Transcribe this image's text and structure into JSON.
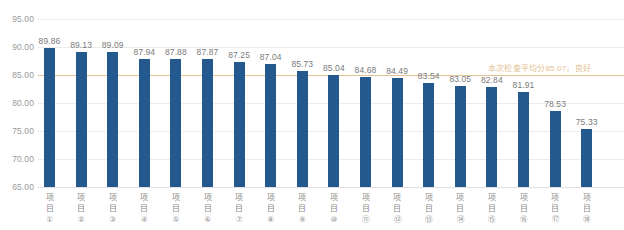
{
  "chart_data": {
    "type": "bar",
    "title": "",
    "xlabel": "",
    "ylabel": "",
    "ylim": [
      65,
      95
    ],
    "grid": true,
    "legend": "none",
    "yticks": [
      "95.00",
      "90.00",
      "85.00",
      "80.00",
      "75.00",
      "70.00",
      "65.00"
    ],
    "ytick_values": [
      95,
      90,
      85,
      80,
      75,
      70,
      65
    ],
    "categories": [
      "项目①",
      "项目②",
      "项目③",
      "项目④",
      "项目⑤",
      "项目⑥",
      "项目⑦",
      "项目⑧",
      "项目⑨",
      "项目⑩",
      "项目⑪",
      "项目⑫",
      "项目⑬",
      "项目⑭",
      "项目⑮",
      "项目⑯",
      "项目⑰",
      "项目⑱"
    ],
    "category_parts": [
      {
        "word": "项目",
        "num": "①"
      },
      {
        "word": "项目",
        "num": "②"
      },
      {
        "word": "项目",
        "num": "③"
      },
      {
        "word": "项目",
        "num": "④"
      },
      {
        "word": "项目",
        "num": "⑤"
      },
      {
        "word": "项目",
        "num": "⑥"
      },
      {
        "word": "项目",
        "num": "⑦"
      },
      {
        "word": "项目",
        "num": "⑧"
      },
      {
        "word": "项目",
        "num": "⑨"
      },
      {
        "word": "项目",
        "num": "⑩"
      },
      {
        "word": "项目",
        "num": "⑪"
      },
      {
        "word": "项目",
        "num": "⑫"
      },
      {
        "word": "项目",
        "num": "⑬"
      },
      {
        "word": "项目",
        "num": "⑭"
      },
      {
        "word": "项目",
        "num": "⑮"
      },
      {
        "word": "项目",
        "num": "⑯"
      },
      {
        "word": "项目",
        "num": "⑰"
      },
      {
        "word": "项目",
        "num": "⑱"
      }
    ],
    "values": [
      89.86,
      89.13,
      89.09,
      87.94,
      87.88,
      87.87,
      87.25,
      87.04,
      85.73,
      85.04,
      84.68,
      84.49,
      83.54,
      83.05,
      82.84,
      81.91,
      78.53,
      75.33
    ],
    "value_labels": [
      "89.86",
      "89.13",
      "89.09",
      "87.94",
      "87.88",
      "87.87",
      "87.25",
      "87.04",
      "85.73",
      "85.04",
      "84.68",
      "84.49",
      "83.54",
      "83.05",
      "82.84",
      "81.91",
      "78.53",
      "75.33"
    ],
    "reference_line": {
      "value": 85.07,
      "label": "本次检查平均分85.07，良好",
      "color": "#e3bf94"
    },
    "colors": {
      "bar": "#23598c",
      "gridline": "#ececec",
      "reference": "#e3bf94",
      "axis_text": "#9a9a9a",
      "value_text": "#7b7b7b",
      "background": "#ffffff"
    }
  }
}
